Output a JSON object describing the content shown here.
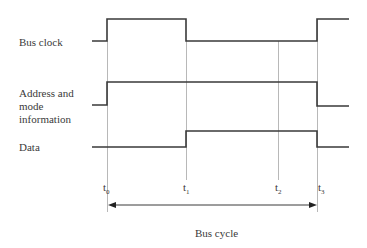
{
  "diagram": {
    "type": "timing-diagram",
    "signals": [
      {
        "name": "Bus clock",
        "label_lines": [
          "Bus clock"
        ]
      },
      {
        "name": "Address and mode information",
        "label_lines": [
          "Address and",
          "mode",
          "information"
        ]
      },
      {
        "name": "Data",
        "label_lines": [
          "Data"
        ]
      }
    ],
    "time_markers": [
      {
        "base": "t",
        "sub": "0"
      },
      {
        "base": "t",
        "sub": "1"
      },
      {
        "base": "t",
        "sub": "2"
      },
      {
        "base": "t",
        "sub": "3"
      }
    ],
    "span_label": "Bus cycle",
    "colors": {
      "waveform": "#3a3a3a",
      "guide": "#b0b0b0",
      "text": "#3a3a3a"
    }
  }
}
